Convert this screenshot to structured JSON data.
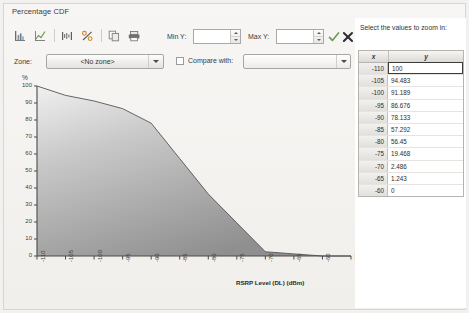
{
  "panel": {
    "title": "Percentage CDF"
  },
  "toolbar": {
    "buttons": [
      {
        "name": "bar-chart-icon",
        "label": "Bar chart"
      },
      {
        "name": "line-chart-icon",
        "label": "Line chart"
      },
      {
        "name": "histogram-icon",
        "label": "Histogram"
      },
      {
        "name": "percent-icon",
        "label": "Percent"
      },
      {
        "name": "copy-icon",
        "label": "Copy"
      },
      {
        "name": "save-icon",
        "label": "Save"
      }
    ]
  },
  "controls": {
    "min_y_label": "Min Y:",
    "min_y_value": "",
    "min_y_placeholder": "",
    "max_y_label": "Max Y:",
    "max_y_value": "",
    "max_y_placeholder": "",
    "apply_icon": "check-icon",
    "cancel_icon": "close-icon",
    "zone_label": "Zone:",
    "zone_value": "<No zone>",
    "compare_label": "Compare with:",
    "compare_value": "",
    "compare_checked": false
  },
  "right_panel": {
    "title": "Select the values to zoom in:",
    "columns": [
      "x",
      "y"
    ],
    "rows": [
      {
        "x": "-110",
        "y": "100",
        "selected": true
      },
      {
        "x": "-105",
        "y": "94.483",
        "selected": false
      },
      {
        "x": "-100",
        "y": "91.189",
        "selected": false
      },
      {
        "x": "-95",
        "y": "86.676",
        "selected": false
      },
      {
        "x": "-90",
        "y": "78.133",
        "selected": false
      },
      {
        "x": "-85",
        "y": "57.292",
        "selected": false
      },
      {
        "x": "-80",
        "y": "56.45",
        "selected": false
      },
      {
        "x": "-75",
        "y": "19.468",
        "selected": false
      },
      {
        "x": "-70",
        "y": "2.486",
        "selected": false
      },
      {
        "x": "-65",
        "y": "1.243",
        "selected": false
      },
      {
        "x": "-60",
        "y": "0",
        "selected": false
      }
    ]
  },
  "chart_data": {
    "type": "area",
    "title": "Percentage CDF",
    "xlabel": "RSRP Level (DL) (dBm)",
    "ylabel": "%",
    "ylim": [
      0,
      100
    ],
    "xlim": [
      -110,
      -55
    ],
    "grid": false,
    "legend": null,
    "accent_color": "#8a8a8a",
    "line_color": "#555555",
    "x": [
      -110,
      -105,
      -100,
      -95,
      -90,
      -85,
      -80,
      -75,
      -70,
      -65,
      -60,
      -55
    ],
    "values": [
      100,
      94.483,
      91.189,
      86.676,
      78.133,
      57.292,
      36.45,
      19.468,
      2.486,
      1.243,
      0,
      0
    ],
    "xtick_labels": [
      "-110",
      "-105",
      "-100",
      "-95",
      "-90",
      "-85",
      "-80",
      "-75",
      "-70",
      "-65",
      "-60",
      "-55"
    ],
    "ytick_labels": [
      "0",
      "10",
      "20",
      "30",
      "40",
      "50",
      "60",
      "70",
      "80",
      "90",
      "100"
    ]
  }
}
